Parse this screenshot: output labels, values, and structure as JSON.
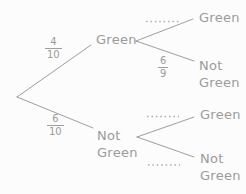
{
  "diagram_type": "probability-tree",
  "colors": {
    "background": "#fcfcfc",
    "line": "#9e9e9e",
    "text": "#9b9b9b",
    "dotted_blank": "#b0b0b0"
  },
  "tree": {
    "level1": [
      {
        "fraction": {
          "num": "4",
          "den": "10"
        },
        "label1": "Green",
        "label2": ""
      },
      {
        "fraction": {
          "num": "6",
          "den": "10"
        },
        "label1": "Not",
        "label2": "Green"
      }
    ],
    "level2_from_green": [
      {
        "probability_blank": "dotted",
        "label1": "Green",
        "label2": ""
      },
      {
        "fraction": {
          "num": "6",
          "den": "9"
        },
        "label1": "Not",
        "label2": "Green"
      }
    ],
    "level2_from_not_green": [
      {
        "probability_blank": "dotted",
        "label1": "Green",
        "label2": ""
      },
      {
        "probability_blank": "dotted",
        "label1": "Not",
        "label2": "Green"
      }
    ]
  }
}
